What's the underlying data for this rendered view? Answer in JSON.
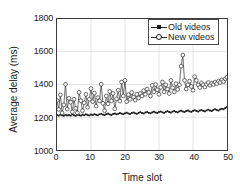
{
  "chart_data": {
    "type": "line",
    "title": "",
    "xlabel": "Time slot",
    "ylabel": "Average delay (ms)",
    "xlim": [
      0,
      50
    ],
    "ylim": [
      1000,
      1800
    ],
    "xticks": [
      0,
      10,
      20,
      30,
      40,
      50
    ],
    "yticks": [
      1000,
      1200,
      1400,
      1600,
      1800
    ],
    "grid": true,
    "legend_position": "top-right",
    "series": [
      {
        "name": "Old videos",
        "marker": "filled-square",
        "color": "#1a1a1a",
        "x": [
          0,
          0.5,
          1,
          1.5,
          2,
          2.5,
          3,
          3.5,
          4,
          4.5,
          5,
          5.5,
          6,
          6.5,
          7,
          7.5,
          8,
          8.5,
          9,
          9.5,
          10,
          10.5,
          11,
          11.5,
          12,
          12.5,
          13,
          13.5,
          14,
          14.5,
          15,
          15.5,
          16,
          16.5,
          17,
          17.5,
          18,
          18.5,
          19,
          19.5,
          20,
          20.5,
          21,
          21.5,
          22,
          22.5,
          23,
          23.5,
          24,
          24.5,
          25,
          25.5,
          26,
          26.5,
          27,
          27.5,
          28,
          28.5,
          29,
          29.5,
          30,
          30.5,
          31,
          31.5,
          32,
          32.5,
          33,
          33.5,
          34,
          34.5,
          35,
          35.5,
          36,
          36.5,
          37,
          37.5,
          38,
          38.5,
          39,
          39.5,
          40,
          40.5,
          41,
          41.5,
          42,
          42.5,
          43,
          43.5,
          44,
          44.5,
          45,
          45.5,
          46,
          46.5,
          47,
          47.5,
          48,
          48.5,
          49,
          49.5,
          50
        ],
        "values": [
          1213,
          1210,
          1216,
          1212,
          1209,
          1215,
          1211,
          1214,
          1210,
          1217,
          1212,
          1209,
          1215,
          1213,
          1210,
          1216,
          1212,
          1218,
          1214,
          1211,
          1217,
          1213,
          1219,
          1215,
          1212,
          1218,
          1221,
          1216,
          1213,
          1219,
          1222,
          1217,
          1214,
          1220,
          1223,
          1218,
          1221,
          1226,
          1222,
          1219,
          1224,
          1228,
          1223,
          1220,
          1226,
          1229,
          1224,
          1221,
          1227,
          1231,
          1226,
          1223,
          1229,
          1232,
          1227,
          1224,
          1230,
          1234,
          1229,
          1226,
          1232,
          1235,
          1230,
          1227,
          1233,
          1237,
          1232,
          1229,
          1235,
          1238,
          1233,
          1230,
          1236,
          1240,
          1235,
          1232,
          1238,
          1241,
          1236,
          1233,
          1239,
          1243,
          1238,
          1235,
          1241,
          1244,
          1239,
          1236,
          1242,
          1246,
          1241,
          1238,
          1245,
          1249,
          1244,
          1241,
          1248,
          1252,
          1249,
          1256,
          1262
        ]
      },
      {
        "name": "New videos",
        "marker": "open-circle",
        "color": "#2b2b2b",
        "x": [
          0,
          0.5,
          1,
          1.5,
          2,
          2.5,
          3,
          3.5,
          4,
          4.5,
          5,
          5.5,
          6,
          6.5,
          7,
          7.5,
          8,
          8.5,
          9,
          9.5,
          10,
          10.5,
          11,
          11.5,
          12,
          12.5,
          13,
          13.5,
          14,
          14.5,
          15,
          15.5,
          16,
          16.5,
          17,
          17.5,
          18,
          18.5,
          19,
          19.5,
          20,
          20.5,
          21,
          21.5,
          22,
          22.5,
          23,
          23.5,
          24,
          24.5,
          25,
          25.5,
          26,
          26.5,
          27,
          27.5,
          28,
          28.5,
          29,
          29.5,
          30,
          30.5,
          31,
          31.5,
          32,
          32.5,
          33,
          33.5,
          34,
          34.5,
          35,
          35.5,
          36,
          36.5,
          37,
          37.5,
          38,
          38.5,
          39,
          39.5,
          40,
          40.5,
          41,
          41.5,
          42,
          42.5,
          43,
          43.5,
          44,
          44.5,
          45,
          45.5,
          46,
          46.5,
          47,
          47.5,
          48,
          48.5,
          49,
          49.5,
          50
        ],
        "values": [
          1302,
          1248,
          1337,
          1226,
          1275,
          1401,
          1250,
          1316,
          1292,
          1233,
          1310,
          1255,
          1227,
          1352,
          1301,
          1240,
          1288,
          1340,
          1261,
          1310,
          1375,
          1295,
          1348,
          1268,
          1320,
          1300,
          1402,
          1285,
          1240,
          1330,
          1282,
          1358,
          1300,
          1345,
          1252,
          1312,
          1365,
          1299,
          1415,
          1330,
          1425,
          1295,
          1338,
          1310,
          1352,
          1322,
          1305,
          1340,
          1318,
          1345,
          1330,
          1362,
          1340,
          1372,
          1352,
          1330,
          1395,
          1355,
          1400,
          1368,
          1340,
          1382,
          1415,
          1355,
          1398,
          1372,
          1345,
          1425,
          1380,
          1355,
          1405,
          1370,
          1398,
          1512,
          1580,
          1425,
          1372,
          1398,
          1420,
          1388,
          1365,
          1448,
          1425,
          1398,
          1382,
          1410,
          1398,
          1385,
          1402,
          1412,
          1395,
          1408,
          1400,
          1415,
          1405,
          1420,
          1412,
          1428,
          1418,
          1435,
          1445
        ]
      }
    ]
  },
  "axes": {
    "x_tick_labels": [
      "0",
      "10",
      "20",
      "30",
      "40",
      "50"
    ],
    "y_tick_labels": [
      "1000",
      "1200",
      "1400",
      "1600",
      "1800"
    ],
    "x_title": "Time slot",
    "y_title": "Average delay (ms)"
  },
  "legend": {
    "entries": [
      {
        "label": "Old videos",
        "marker": "filled-square-marker-icon"
      },
      {
        "label": "New videos",
        "marker": "open-circle-marker-icon"
      }
    ]
  },
  "colors": {
    "axis": "#3a3a3a",
    "grid": "#d8d8d8",
    "old_series": "#1a1a1a",
    "new_series": "#2b2b2b",
    "background": "#ffffff"
  }
}
